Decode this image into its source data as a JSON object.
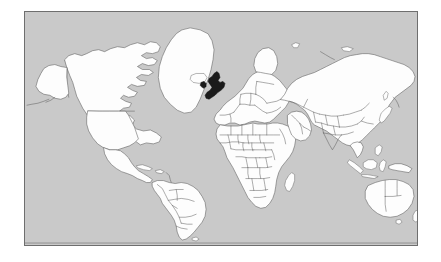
{
  "page": {
    "background_color": "#ffffff",
    "width": 441,
    "height": 262
  },
  "map": {
    "frame": {
      "border_color": "#6e6e6e",
      "x": 24,
      "y": 11,
      "width": 394,
      "height": 235
    },
    "projection": "mercator",
    "ocean_color": "#c9c9c9",
    "land_color": "#fdfdfd",
    "border_color": "#5a5a5a",
    "highlight_color": "#1b1b1b",
    "highlighted_regions": [
      "United Kingdom"
    ],
    "regions_shown": [
      "North America",
      "South America",
      "Europe",
      "Africa",
      "Asia",
      "Oceania",
      "Greenland"
    ],
    "labels": [],
    "legend": [],
    "alt_text": "World map with country borders, United Kingdom shaded black"
  },
  "chart_data": {
    "type": "map",
    "highlighted": [
      "United Kingdom"
    ],
    "ocean_color": "#c9c9c9",
    "land_color": "#fdfdfd",
    "highlight_color": "#1b1b1b"
  }
}
